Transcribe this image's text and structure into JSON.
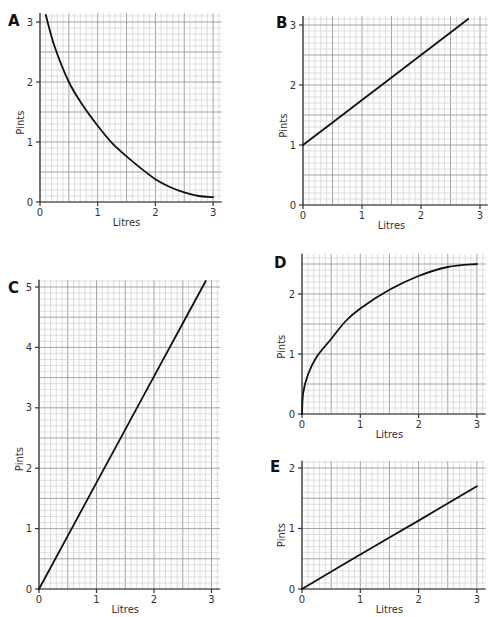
{
  "figure": {
    "panels": [
      "A",
      "B",
      "C",
      "D",
      "E"
    ]
  },
  "chart_data": [
    {
      "id": "A",
      "type": "line",
      "title": "A",
      "xlabel": "Litres",
      "ylabel": "Pints",
      "xlim": [
        0,
        3.15
      ],
      "ylim": [
        0,
        3.15
      ],
      "xticks": [
        0,
        1,
        2,
        3
      ],
      "yticks": [
        0,
        1,
        2,
        3
      ],
      "grid": true,
      "grid_minor_step": 0.1,
      "series": [
        {
          "name": "A",
          "shape": "decreasing curve",
          "x": [
            0.1,
            0.25,
            0.5,
            0.75,
            1.0,
            1.25,
            1.5,
            1.75,
            2.0,
            2.25,
            2.5,
            2.75,
            3.0
          ],
          "y": [
            3.12,
            2.6,
            2.0,
            1.6,
            1.27,
            0.98,
            0.76,
            0.56,
            0.38,
            0.25,
            0.16,
            0.1,
            0.08
          ]
        }
      ]
    },
    {
      "id": "B",
      "type": "line",
      "title": "B",
      "xlabel": "Litres",
      "ylabel": "Pints",
      "xlim": [
        0,
        3.13
      ],
      "ylim": [
        0,
        3.15
      ],
      "xticks": [
        0,
        1,
        2,
        3
      ],
      "yticks": [
        0,
        1,
        2,
        3
      ],
      "grid": true,
      "grid_minor_step": 0.1,
      "series": [
        {
          "name": "B",
          "shape": "straight line",
          "x": [
            0,
            1,
            2,
            2.8
          ],
          "y": [
            1.0,
            1.75,
            2.5,
            3.1
          ]
        }
      ]
    },
    {
      "id": "C",
      "type": "line",
      "title": "C",
      "xlabel": "Litres",
      "ylabel": "Pints",
      "xlim": [
        0,
        3.15
      ],
      "ylim": [
        0,
        5.12
      ],
      "xticks": [
        0,
        1,
        2,
        3
      ],
      "yticks": [
        0,
        1,
        2,
        3,
        4,
        5
      ],
      "grid": true,
      "grid_minor_step": 0.1,
      "series": [
        {
          "name": "C",
          "shape": "straight line through origin",
          "x": [
            0,
            1,
            2,
            2.9
          ],
          "y": [
            0,
            1.76,
            3.52,
            5.1
          ]
        }
      ]
    },
    {
      "id": "D",
      "type": "line",
      "title": "D",
      "xlabel": "Litres",
      "ylabel": "Pints",
      "xlim": [
        0,
        3.15
      ],
      "ylim": [
        0,
        2.67
      ],
      "xticks": [
        0,
        1,
        2,
        3
      ],
      "yticks": [
        0,
        1,
        2
      ],
      "grid": true,
      "grid_minor_step": 0.1,
      "series": [
        {
          "name": "D",
          "shape": "increasing concave curve",
          "x": [
            0,
            0.02,
            0.1,
            0.25,
            0.5,
            0.75,
            1.0,
            1.5,
            2.0,
            2.5,
            3.0
          ],
          "y": [
            0,
            0.35,
            0.65,
            0.95,
            1.25,
            1.55,
            1.76,
            2.07,
            2.3,
            2.45,
            2.5
          ]
        }
      ]
    },
    {
      "id": "E",
      "type": "line",
      "title": "E",
      "xlabel": "Litres",
      "ylabel": "Pints",
      "xlim": [
        0,
        3.15
      ],
      "ylim": [
        0,
        2.12
      ],
      "xticks": [
        0,
        1,
        2,
        3
      ],
      "yticks": [
        0,
        1,
        2
      ],
      "grid": true,
      "grid_minor_step": 0.1,
      "series": [
        {
          "name": "E",
          "shape": "straight line through origin",
          "x": [
            0,
            1,
            2,
            3
          ],
          "y": [
            0,
            0.57,
            1.13,
            1.7
          ]
        }
      ]
    }
  ],
  "layout": [
    {
      "id": "A",
      "ox": 40,
      "oy": 202,
      "sx": 57.7,
      "sy": 60.0,
      "letter_x": 8,
      "letter_y": 26,
      "ylabel_x": 24,
      "xlabel_y": 226
    },
    {
      "id": "B",
      "ox": 303,
      "oy": 205,
      "sx": 59.0,
      "sy": 60.0,
      "letter_x": 276,
      "letter_y": 28,
      "ylabel_x": 287,
      "xlabel_y": 229
    },
    {
      "id": "C",
      "ox": 39,
      "oy": 589,
      "sx": 57.5,
      "sy": 60.4,
      "letter_x": 8,
      "letter_y": 293,
      "ylabel_x": 23,
      "xlabel_y": 613
    },
    {
      "id": "D",
      "ox": 302,
      "oy": 414,
      "sx": 58.3,
      "sy": 60.0,
      "letter_x": 274,
      "letter_y": 268,
      "ylabel_x": 285,
      "xlabel_y": 438
    },
    {
      "id": "E",
      "ox": 302,
      "oy": 589,
      "sx": 58.3,
      "sy": 60.5,
      "letter_x": 270,
      "letter_y": 472,
      "ylabel_x": 285,
      "xlabel_y": 613
    }
  ]
}
